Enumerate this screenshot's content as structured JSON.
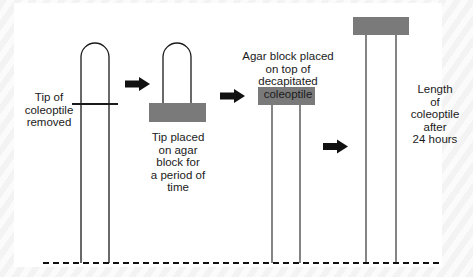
{
  "diagram": {
    "colors": {
      "line": "#1a1a1a",
      "agar_block": "#7a7a7a",
      "arrow": "#111111",
      "background": "#ffffff",
      "border_pattern": "#f0f0f0"
    },
    "labels": {
      "tip_removed": "Tip of\ncoleoptile\nremoved",
      "tip_on_agar": "Tip placed\non agar\nblock for\na period of\ntime",
      "block_on_decapitated": "Agar block placed\non top of decapitated\ncoleoptile",
      "length_after": "Length\nof\ncoleoptile\nafter\n24 hours"
    },
    "stages": [
      {
        "id": 1,
        "name": "intact-coleoptile-with-cut-line"
      },
      {
        "id": 2,
        "name": "tip-on-agar-block"
      },
      {
        "id": 3,
        "name": "agar-block-on-decapitated-coleoptile"
      },
      {
        "id": 4,
        "name": "elongated-coleoptile-after-24-hours"
      }
    ],
    "arrows": [
      {
        "id": 1,
        "icon": "right-arrow-icon"
      },
      {
        "id": 2,
        "icon": "right-arrow-icon"
      },
      {
        "id": 3,
        "icon": "right-arrow-icon"
      }
    ],
    "baseline": "dashed-ground-line"
  }
}
